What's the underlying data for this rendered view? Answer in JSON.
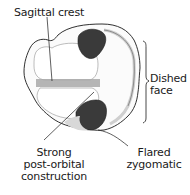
{
  "diagram": {
    "labels": {
      "sagittal_crest": "Sagittal crest",
      "dished_face_1": "Dished",
      "dished_face_2": "face",
      "strong_1": "Strong",
      "strong_2": "post-orbital",
      "strong_3": "construction",
      "flared_1": "Flared",
      "flared_2": "zygomatic"
    },
    "colors": {
      "ink": "#1a1a1a",
      "crest_shade": "#a8a8a8",
      "orbit_dark": "#3a3a3a",
      "bone_fill": "#fbfbfb"
    }
  }
}
